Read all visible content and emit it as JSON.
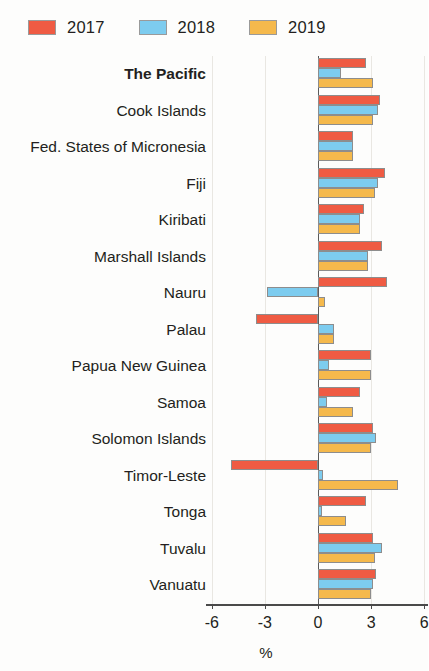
{
  "legend": {
    "position": "top-left",
    "items": [
      {
        "label": "2017",
        "color": "#ef5b43"
      },
      {
        "label": "2018",
        "color": "#7dccef"
      },
      {
        "label": "2019",
        "color": "#f5b94c"
      }
    ]
  },
  "axis": {
    "title": "%",
    "ticks": [
      "-6",
      "-3",
      "0",
      "3",
      "6"
    ],
    "tick_values": [
      -6,
      -3,
      0,
      3,
      6
    ],
    "min": -6,
    "max": 6
  },
  "chart_data": {
    "type": "bar",
    "orientation": "horizontal",
    "title": "",
    "subtitle": "",
    "xlabel": "%",
    "ylabel": "",
    "xlim": [
      -6,
      6
    ],
    "grid": true,
    "legend_position": "top-left",
    "categories": [
      "The Pacific",
      "Cook Islands",
      "Fed. States of Micronesia",
      "Fiji",
      "Kiribati",
      "Marshall Islands",
      "Nauru",
      "Palau",
      "Papua New Guinea",
      "Samoa",
      "Solomon Islands",
      "Timor-Leste",
      "Tonga",
      "Tuvalu",
      "Vanuatu"
    ],
    "emphasized_categories": [
      "The Pacific"
    ],
    "series": [
      {
        "name": "2017",
        "color": "#ef5b43",
        "values": [
          2.7,
          3.5,
          2.0,
          3.8,
          2.6,
          3.6,
          3.9,
          -3.5,
          3.0,
          2.4,
          3.1,
          -4.9,
          2.7,
          3.1,
          3.3
        ]
      },
      {
        "name": "2018",
        "color": "#7dccef",
        "values": [
          1.3,
          3.4,
          2.0,
          3.4,
          2.4,
          2.8,
          -2.9,
          0.9,
          0.6,
          0.5,
          3.3,
          0.3,
          0.2,
          3.6,
          3.1
        ]
      },
      {
        "name": "2019",
        "color": "#f5b94c",
        "values": [
          3.1,
          3.1,
          2.0,
          3.2,
          2.4,
          2.8,
          0.4,
          0.9,
          3.0,
          2.0,
          3.0,
          4.5,
          1.6,
          3.2,
          3.0
        ]
      }
    ]
  }
}
